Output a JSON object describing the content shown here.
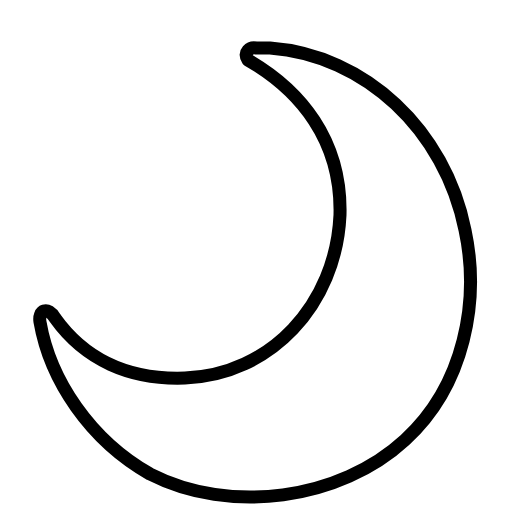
{
  "image": {
    "subject": "crescent-moon",
    "icon": "moon-icon",
    "stroke_color": "#000000",
    "fill_color": "#ffffff",
    "background_color": "#ffffff"
  }
}
